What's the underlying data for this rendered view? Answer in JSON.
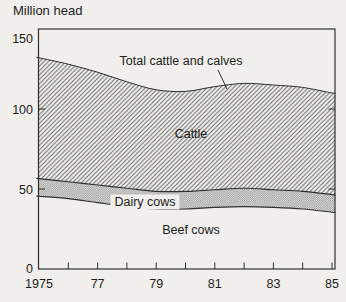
{
  "chart_data": {
    "type": "area",
    "title": "Million head",
    "x": [
      1975,
      1976,
      1977,
      1978,
      1979,
      1980,
      1981,
      1982,
      1983,
      1984,
      1985
    ],
    "series": [
      {
        "name": "Beef cows",
        "boundary_values": [
          45.5,
          44,
          41.5,
          39,
          37.5,
          37.5,
          38.5,
          39,
          38.5,
          37.5,
          35.5
        ],
        "fill": "none"
      },
      {
        "name": "Dairy cows",
        "boundary_values": [
          56.5,
          54.5,
          52.5,
          50.5,
          48.5,
          48.5,
          49.5,
          50.5,
          49.5,
          48.5,
          46.5
        ],
        "fill": "checker"
      },
      {
        "name": "Total cattle and calves",
        "boundary_values": [
          132,
          128,
          123,
          117,
          112,
          111,
          114,
          116,
          115,
          113.5,
          110
        ],
        "fill": "diagonal-hatch"
      }
    ],
    "stacking_note": "boundary_values are cumulative tops read off the y-axis; region between a boundary and the one below it belongs to that series",
    "ylim": [
      0,
      150
    ],
    "yticks": [
      {
        "value": 0,
        "label": "0",
        "dy": 0
      },
      {
        "value": 50,
        "label": "50",
        "dy": 1
      },
      {
        "value": 100,
        "label": "100",
        "dy": 1
      },
      {
        "value": 150,
        "label": "150",
        "dy": 10
      }
    ],
    "xtick_labels": [
      {
        "year": 1975,
        "label": "1975"
      },
      {
        "year": 1977,
        "label": "77"
      },
      {
        "year": 1979,
        "label": "79"
      },
      {
        "year": 1981,
        "label": "81"
      },
      {
        "year": 1983,
        "label": "83"
      },
      {
        "year": 1985,
        "label": "85"
      }
    ],
    "grid": false,
    "legend": "inline annotations",
    "annotations": [
      {
        "id": "total-cattle-label",
        "text": "Total cattle and calves",
        "x": 181,
        "y": 61,
        "boxed": false
      },
      {
        "id": "cattle-label",
        "text": "Cattle",
        "x": 191,
        "y": 134,
        "boxed": false
      },
      {
        "id": "dairy-cows-label",
        "text": "Dairy cows",
        "x": 145,
        "y": 202,
        "boxed": true
      },
      {
        "id": "beef-cows-label",
        "text": "Beef cows",
        "x": 191,
        "y": 230,
        "boxed": false
      }
    ],
    "leader_line": {
      "x1": 218,
      "y1": 70,
      "x2": 227,
      "y2": 89
    },
    "colors": {
      "paper": "#f0efeb",
      "ink": "#2f2f2f",
      "text": "#1c1c1c",
      "hatch_line": "#606060",
      "checker_dot": "#8e8e8e"
    }
  }
}
